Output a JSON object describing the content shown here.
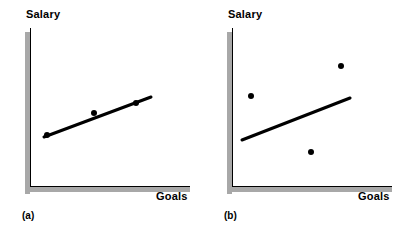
{
  "figure": {
    "panels": [
      {
        "caption": "(a)",
        "ylabel": "Salary",
        "xlabel": "Goals",
        "caption_pos": {
          "x": 22,
          "y": 210
        },
        "ylabel_pos": {
          "x": 26,
          "y": 8
        },
        "xlabel_pos": {
          "x": 156,
          "y": 190
        },
        "axis": {
          "color": "#000000",
          "shadow_color": "#a8a8a8",
          "vertical": {
            "x": 30,
            "y_top": 28,
            "y_bottom": 186
          },
          "horizontal": {
            "y": 186,
            "x_left": 30,
            "x_right": 190
          },
          "shadow_thickness": 5,
          "shadow_offset": 4
        },
        "regression_line": {
          "x1": 44,
          "y1": 137,
          "x2": 151,
          "y2": 97,
          "width": 3,
          "color": "#000000"
        },
        "points": [
          {
            "x": 47,
            "y": 135
          },
          {
            "x": 94,
            "y": 113
          },
          {
            "x": 136,
            "y": 103
          }
        ],
        "point_radius": 3,
        "point_color": "#000000"
      },
      {
        "caption": "(b)",
        "ylabel": "Salary",
        "xlabel": "Goals",
        "caption_pos": {
          "x": 22,
          "y": 210
        },
        "ylabel_pos": {
          "x": 26,
          "y": 8
        },
        "xlabel_pos": {
          "x": 156,
          "y": 190
        },
        "axis": {
          "color": "#000000",
          "shadow_color": "#a8a8a8",
          "vertical": {
            "x": 30,
            "y_top": 28,
            "y_bottom": 186
          },
          "horizontal": {
            "y": 186,
            "x_left": 30,
            "x_right": 190
          },
          "shadow_thickness": 5,
          "shadow_offset": 4
        },
        "regression_line": {
          "x1": 40,
          "y1": 140,
          "x2": 148,
          "y2": 98,
          "width": 3,
          "color": "#000000"
        },
        "points": [
          {
            "x": 49,
            "y": 96
          },
          {
            "x": 109,
            "y": 152
          },
          {
            "x": 139,
            "y": 66
          }
        ],
        "point_radius": 3,
        "point_color": "#000000"
      }
    ]
  },
  "chart_data": {
    "type": "scatter",
    "title": "",
    "xlabel": "Goals",
    "ylabel": "Salary",
    "grid": false,
    "legend": "none",
    "axis_ticks": [],
    "panels": [
      {
        "label": "(a)",
        "description": "Strong positive linear relationship: points lie nearly on the fitted line",
        "xlabel": "Goals",
        "ylabel": "Salary",
        "points": [
          {
            "x": 0.11,
            "y": 0.32
          },
          {
            "x": 0.4,
            "y": 0.46
          },
          {
            "x": 0.66,
            "y": 0.53
          }
        ],
        "fit_line": {
          "x_start": 0.09,
          "y_start": 0.31,
          "x_end": 0.76,
          "y_end": 0.56
        }
      },
      {
        "label": "(b)",
        "description": "Weak relationship: points scattered widely about the fitted line",
        "xlabel": "Goals",
        "ylabel": "Salary",
        "points": [
          {
            "x": 0.12,
            "y": 0.57
          },
          {
            "x": 0.49,
            "y": 0.22
          },
          {
            "x": 0.68,
            "y": 0.76
          }
        ],
        "fit_line": {
          "x_start": 0.06,
          "y_start": 0.29,
          "x_end": 0.74,
          "y_end": 0.55
        }
      }
    ],
    "xlim": [
      0,
      1
    ],
    "ylim": [
      0,
      1
    ]
  }
}
